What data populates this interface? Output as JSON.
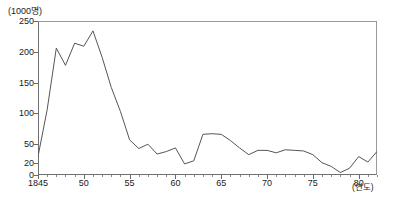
{
  "chart_data": {
    "type": "line",
    "title": "",
    "subtitle": "",
    "unit_label": "(1000명)",
    "xlabel": "(연도)",
    "ylabel": "",
    "xlim": [
      1845,
      1882
    ],
    "ylim": [
      0,
      250
    ],
    "grid": false,
    "legend": "none",
    "y_ticks": [
      0,
      20,
      50,
      100,
      150,
      200,
      250
    ],
    "y_tick_labels": [
      "0",
      "20",
      "50",
      "100",
      "150",
      "200",
      "250"
    ],
    "x_ticks": [
      1845,
      1850,
      1855,
      1860,
      1865,
      1870,
      1875,
      1880
    ],
    "x_tick_labels": [
      "1845",
      "50",
      "55",
      "60",
      "65",
      "70",
      "75",
      "80"
    ],
    "x_minor_step": 1,
    "line_color": "#555555",
    "series": [
      {
        "name": "",
        "x": [
          1845,
          1846,
          1847,
          1848,
          1849,
          1850,
          1851,
          1852,
          1853,
          1854,
          1855,
          1856,
          1857,
          1858,
          1859,
          1860,
          1861,
          1862,
          1863,
          1864,
          1865,
          1866,
          1867,
          1868,
          1869,
          1870,
          1871,
          1872,
          1873,
          1874,
          1875,
          1876,
          1877,
          1878,
          1879,
          1880,
          1881,
          1882
        ],
        "values": [
          30,
          106,
          206,
          178,
          214,
          209,
          234,
          191,
          142,
          103,
          57,
          43,
          50,
          34,
          38,
          44,
          18,
          23,
          66,
          67,
          66,
          56,
          44,
          33,
          40,
          40,
          36,
          41,
          40,
          39,
          33,
          20,
          14,
          4,
          11,
          30,
          21,
          38
        ]
      }
    ]
  }
}
